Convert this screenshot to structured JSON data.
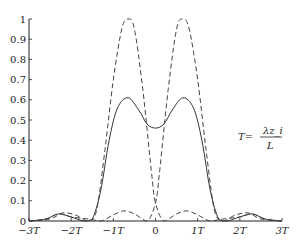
{
  "chart_data": {
    "type": "line",
    "title": "",
    "xlabel": "",
    "ylabel": "",
    "xlim": [
      -3,
      3
    ],
    "ylim": [
      0,
      1
    ],
    "grid": false,
    "x_ticks": [
      "-3T",
      "-2T",
      "-1T",
      "0",
      "1T",
      "2T",
      "3T"
    ],
    "y_ticks": [
      "0",
      "0.1",
      "0.2",
      "0.3",
      "0.4",
      "0.5",
      "0.6",
      "0.7",
      "0.8",
      "0.9",
      "1"
    ],
    "annotation": {
      "lhs": "T=",
      "numerator": "λz_i",
      "denominator": "L"
    },
    "series": [
      {
        "name": "combined",
        "style": "solid",
        "x": [
          -3,
          -2.6,
          -2.3,
          -2.0,
          -1.7,
          -1.5,
          -1.3,
          -1.1,
          -0.9,
          -0.65,
          -0.4,
          -0.2,
          0,
          0.2,
          0.4,
          0.65,
          0.9,
          1.1,
          1.3,
          1.5,
          1.7,
          2.0,
          2.3,
          2.6,
          3
        ],
        "values": [
          0,
          0.01,
          0.035,
          0.02,
          0,
          0.01,
          0.15,
          0.4,
          0.56,
          0.61,
          0.55,
          0.48,
          0.46,
          0.48,
          0.55,
          0.61,
          0.56,
          0.4,
          0.15,
          0.01,
          0,
          0.02,
          0.035,
          0.01,
          0
        ]
      },
      {
        "name": "left-beam",
        "style": "dashed",
        "x": [
          -3,
          -2.5,
          -2.2,
          -1.9,
          -1.6,
          -1.4,
          -1.2,
          -1.0,
          -0.8,
          -0.65,
          -0.5,
          -0.3,
          -0.1,
          0,
          0.2,
          0.5,
          0.75,
          1.0,
          1.3,
          1.6,
          2.0,
          2.3,
          2.6,
          3
        ],
        "values": [
          0,
          0.01,
          0.04,
          0.03,
          0,
          0.05,
          0.35,
          0.7,
          0.95,
          1.0,
          0.95,
          0.65,
          0.25,
          0.09,
          0,
          0.035,
          0.05,
          0.03,
          0,
          0.01,
          0.02,
          0.035,
          0.01,
          0
        ]
      },
      {
        "name": "right-beam",
        "style": "dashed",
        "x": [
          -3,
          -2.6,
          -2.3,
          -2.0,
          -1.6,
          -1.3,
          -1.0,
          -0.75,
          -0.5,
          -0.2,
          0,
          0.1,
          0.3,
          0.5,
          0.65,
          0.8,
          1.0,
          1.2,
          1.4,
          1.6,
          1.9,
          2.2,
          2.5,
          3
        ],
        "values": [
          0,
          0.01,
          0.035,
          0.02,
          0.01,
          0,
          0.03,
          0.05,
          0.035,
          0,
          0.09,
          0.25,
          0.65,
          0.95,
          1.0,
          0.95,
          0.7,
          0.35,
          0.05,
          0,
          0.03,
          0.04,
          0.01,
          0
        ]
      }
    ]
  }
}
